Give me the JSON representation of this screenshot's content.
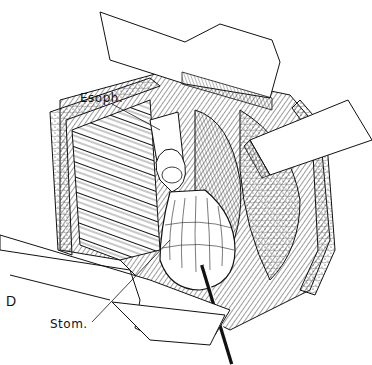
{
  "figure": {
    "panel_letter": "D",
    "labels": {
      "esophagus": "Esoph.",
      "stomach": "Stom."
    },
    "signature": "signature",
    "colors": {
      "ink": "#111111",
      "background": "#ffffff",
      "retractor_fill": "#ffffff"
    }
  }
}
